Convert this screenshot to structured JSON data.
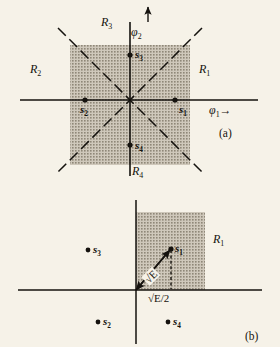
{
  "figure": {
    "caption_a": "(a)",
    "caption_b": "(b)",
    "colors": {
      "background": "#f6f2e8",
      "ink": "#15120e",
      "shading": "#b9b3a6"
    }
  },
  "panel_a": {
    "axes": {
      "x_label": "φ",
      "x_label_sub": "1",
      "x_arrow": "→",
      "y_label": "φ",
      "y_label_sub": "2",
      "y_arrow": "↑"
    },
    "regions": [
      {
        "name": "R",
        "sub": "1",
        "position": "right"
      },
      {
        "name": "R",
        "sub": "2",
        "position": "left"
      },
      {
        "name": "R",
        "sub": "3",
        "position": "top"
      },
      {
        "name": "R",
        "sub": "4",
        "position": "bottom"
      }
    ],
    "signals": [
      {
        "name": "s",
        "sub": "1",
        "quadrant": "positive-phi1-axis"
      },
      {
        "name": "s",
        "sub": "2",
        "quadrant": "negative-phi1-axis"
      },
      {
        "name": "s",
        "sub": "3",
        "quadrant": "positive-phi2-axis"
      },
      {
        "name": "s",
        "sub": "4",
        "quadrant": "negative-phi2-axis"
      }
    ]
  },
  "panel_b": {
    "regions": [
      {
        "name": "R",
        "sub": "1",
        "position": "right-of-shaded-strip"
      }
    ],
    "signals": [
      {
        "name": "s",
        "sub": "1",
        "quadrant": "upper-right"
      },
      {
        "name": "s",
        "sub": "2",
        "quadrant": "lower-left"
      },
      {
        "name": "s",
        "sub": "3",
        "quadrant": "upper-left"
      },
      {
        "name": "s",
        "sub": "4",
        "quadrant": "lower-right"
      }
    ],
    "annotations": {
      "vector_magnitude": "√E",
      "projection": "√E/2"
    }
  }
}
